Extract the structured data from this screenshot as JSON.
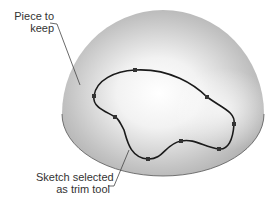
{
  "labels": {
    "keep": {
      "line1": "Piece to",
      "line2": "keep"
    },
    "sketch": {
      "line1": "Sketch selected",
      "line2": "as trim tool"
    }
  },
  "colors": {
    "dome_base": "#b4b4b4",
    "dome_highlight": "#ffffff",
    "sketch_line": "#1a1a1a",
    "leader_line": "#444444"
  }
}
